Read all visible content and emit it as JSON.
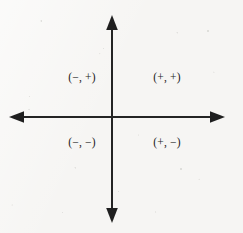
{
  "figure": {
    "width": 243,
    "height": 233,
    "background_color": "#f6f5f3",
    "ink_color": "#242424"
  },
  "axes": {
    "origin": {
      "x": 112,
      "y": 117
    },
    "vertical": {
      "top_y": 16,
      "bottom_y": 222,
      "x": 112
    },
    "horizontal": {
      "left_x": 10,
      "right_x": 224,
      "y": 117
    },
    "line_width": 1.4,
    "arrowheads": {
      "up": "arrow-up-icon",
      "down": "arrow-down-icon",
      "left": "arrow-left-icon",
      "right": "arrow-right-icon"
    }
  },
  "quadrants": [
    {
      "id": "quadrant-ii",
      "label": "(−, +)",
      "x": 82,
      "y": 78
    },
    {
      "id": "quadrant-i",
      "label": "(+, +)",
      "x": 167,
      "y": 78
    },
    {
      "id": "quadrant-iii",
      "label": "(−, −)",
      "x": 82,
      "y": 143
    },
    {
      "id": "quadrant-iv",
      "label": "(+, −)",
      "x": 167,
      "y": 143
    }
  ]
}
